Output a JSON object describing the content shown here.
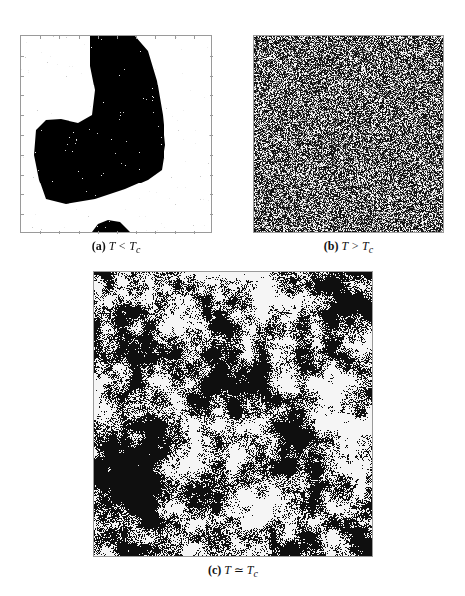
{
  "figure": {
    "panels": [
      {
        "id": "a",
        "label": "(a)",
        "caption_math": "T < T",
        "caption_sub": "c",
        "description": "Low temperature: large ordered black domain",
        "state": "ordered",
        "box": {
          "x": 20,
          "y": 35,
          "w": 192,
          "h": 198
        }
      },
      {
        "id": "b",
        "label": "(b)",
        "caption_math": "T > T",
        "caption_sub": "c",
        "description": "High temperature: random disordered spins",
        "state": "disordered",
        "box": {
          "x": 253,
          "y": 35,
          "w": 191,
          "h": 198
        }
      },
      {
        "id": "c",
        "label": "(c)",
        "caption_math": "T ≃ T",
        "caption_sub": "c",
        "description": "Critical temperature: fractal clusters at all scales",
        "state": "critical",
        "box": {
          "x": 93,
          "y": 271,
          "w": 280,
          "h": 286
        }
      }
    ],
    "colors": {
      "spin_up": "#ffffff",
      "spin_down": "#000000",
      "frame": "#9a9a9a"
    }
  }
}
